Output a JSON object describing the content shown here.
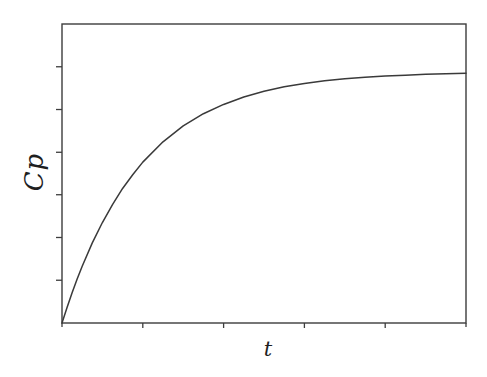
{
  "figure": {
    "ylabel": "Cp",
    "xlabel": "t"
  },
  "chart_data": {
    "type": "line",
    "title": "",
    "xlabel": "t",
    "ylabel": "Cp",
    "x_axis": {
      "label": "t",
      "tick_labels": [],
      "internal_tick_fractions": [
        0.2,
        0.4,
        0.6,
        0.8
      ],
      "corner_tick_fractions": [
        0,
        1
      ],
      "range_normalized": [
        0,
        1
      ],
      "grid": false
    },
    "y_axis": {
      "label": "Cp",
      "tick_labels": [],
      "internal_tick_fractions": [
        0.143,
        0.286,
        0.429,
        0.571,
        0.714,
        0.857
      ],
      "range_normalized": [
        0,
        1
      ],
      "grid": false
    },
    "plateau_fraction_of_axis": 0.84,
    "series": [
      {
        "name": "Cp(t)",
        "points_normalized": [
          [
            0,
            0
          ],
          [
            0.0125,
            0.052
          ],
          [
            0.025,
            0.101
          ],
          [
            0.0375,
            0.147
          ],
          [
            0.05,
            0.19
          ],
          [
            0.075,
            0.268
          ],
          [
            0.1,
            0.336
          ],
          [
            0.125,
            0.396
          ],
          [
            0.15,
            0.45
          ],
          [
            0.175,
            0.496
          ],
          [
            0.2,
            0.538
          ],
          [
            0.25,
            0.606
          ],
          [
            0.3,
            0.659
          ],
          [
            0.35,
            0.7
          ],
          [
            0.4,
            0.731
          ],
          [
            0.45,
            0.756
          ],
          [
            0.5,
            0.775
          ],
          [
            0.55,
            0.79
          ],
          [
            0.6,
            0.801
          ],
          [
            0.65,
            0.81
          ],
          [
            0.7,
            0.817
          ],
          [
            0.75,
            0.822
          ],
          [
            0.8,
            0.826
          ],
          [
            0.85,
            0.829
          ],
          [
            0.9,
            0.832
          ],
          [
            0.95,
            0.834
          ],
          [
            1,
            0.835
          ]
        ]
      }
    ],
    "style": {
      "line_color": "#3a3a3a",
      "axis_color": "#3d3d3d",
      "background": "#ffffff",
      "label_color": "#1f1f1f"
    },
    "layout": {
      "canvas_w": 487,
      "canvas_h": 377,
      "plot_left": 62,
      "plot_top": 24,
      "plot_right": 466,
      "plot_bottom": 323,
      "x_tick_len": 5,
      "y_tick_len": 6,
      "corner_tick_len": 4
    }
  }
}
